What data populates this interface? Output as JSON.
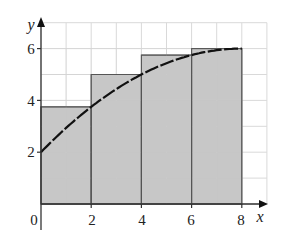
{
  "chart_data": {
    "type": "bar",
    "title": "",
    "xlabel": "x",
    "ylabel": "y",
    "xlim": [
      0,
      9
    ],
    "ylim": [
      0,
      7
    ],
    "grid": true,
    "grid_step": 1,
    "x_ticks": [
      0,
      2,
      4,
      6,
      8
    ],
    "x_tick_labels": [
      "0",
      "2",
      "4",
      "6",
      "8"
    ],
    "y_ticks": [
      2,
      4,
      6
    ],
    "y_tick_labels": [
      "2",
      "4",
      "6"
    ],
    "rectangles": [
      {
        "x_start": 0,
        "x_end": 2,
        "height": 3.75
      },
      {
        "x_start": 2,
        "x_end": 4,
        "height": 5
      },
      {
        "x_start": 4,
        "x_end": 6,
        "height": 5.75
      },
      {
        "x_start": 6,
        "x_end": 8,
        "height": 6
      }
    ],
    "curve": {
      "x": [
        0,
        1,
        2,
        3,
        4,
        5,
        6,
        7,
        8
      ],
      "y": [
        2,
        2.9375,
        3.75,
        4.4375,
        5,
        5.4375,
        5.75,
        5.9375,
        6
      ],
      "style": "dashed"
    },
    "colors": {
      "fill": "#bdbdbd",
      "grid": "#d9d9d9",
      "axis": "#333333",
      "curve": "#111111"
    }
  },
  "labels": {
    "x_axis": "x",
    "y_axis": "y",
    "origin": "0",
    "x2": "2",
    "x4": "4",
    "x6": "6",
    "x8": "8",
    "y2": "2",
    "y4": "4",
    "y6": "6"
  }
}
